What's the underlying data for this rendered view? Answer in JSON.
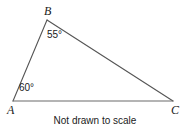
{
  "figure": {
    "type": "geometry-triangle",
    "caption": "Not drawn to scale",
    "background_color": "#ffffff",
    "stroke_color": "#555555",
    "text_color": "#1a1a1a",
    "vertices": [
      {
        "id": "A",
        "label": "A",
        "x": 13,
        "y": 101
      },
      {
        "id": "B",
        "label": "B",
        "x": 47,
        "y": 20
      },
      {
        "id": "C",
        "label": "C",
        "x": 173,
        "y": 101
      }
    ],
    "sides": [
      {
        "id": "AB",
        "from": "A",
        "to": "B"
      },
      {
        "id": "BC",
        "from": "B",
        "to": "C"
      },
      {
        "id": "AC",
        "from": "A",
        "to": "C"
      }
    ],
    "angles": [
      {
        "vertex": "B",
        "label": "55°",
        "value": 55
      },
      {
        "vertex": "A",
        "label": "60°",
        "value": 60
      }
    ]
  }
}
